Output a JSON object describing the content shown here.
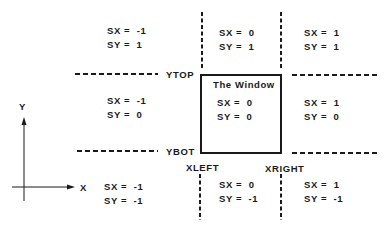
{
  "diagram": {
    "window_label": "The Window",
    "boundaries": {
      "ytop": "YTOP",
      "ybot": "YBOT",
      "xleft": "XLEFT",
      "xright": "XRIGHT"
    },
    "axes": {
      "x_label": "X",
      "y_label": "Y"
    },
    "regions": {
      "top_left": {
        "sx": "SX =  -1",
        "sy": "SY =  1"
      },
      "top_center": {
        "sx": "SX =  0",
        "sy": "SY =  1"
      },
      "top_right": {
        "sx": "SX =  1",
        "sy": "SY =  1"
      },
      "mid_left": {
        "sx": "SX =  -1",
        "sy": "SY =  0"
      },
      "mid_center": {
        "sx": "SX =  0",
        "sy": "SY =  0"
      },
      "mid_right": {
        "sx": "SX =  1",
        "sy": "SY =  0"
      },
      "bottom_left": {
        "sx": "SX =  -1",
        "sy": "SY =  -1"
      },
      "bottom_center": {
        "sx": "SX =  0",
        "sy": "SY =  -1"
      },
      "bottom_right": {
        "sx": "SX =  1",
        "sy": "SY =  -1"
      }
    },
    "colors": {
      "line": "#1a1a1a",
      "background": "#ffffff"
    }
  }
}
